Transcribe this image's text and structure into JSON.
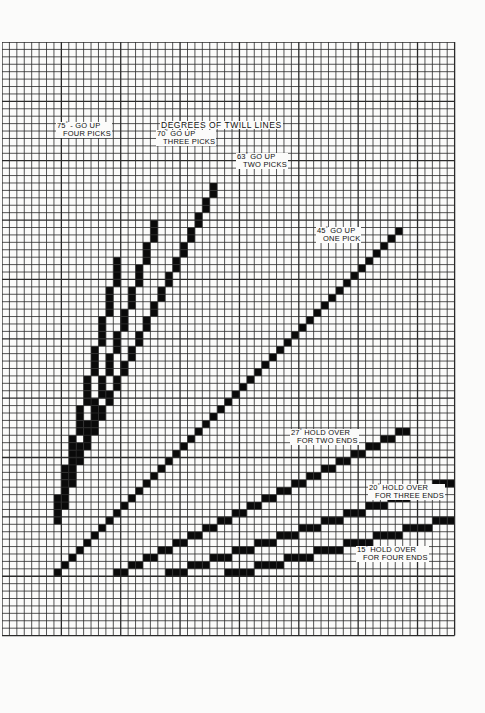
{
  "title": "DEGREES OF TWILL LINES",
  "grid": {
    "cols": 61,
    "rows": 80,
    "cell": 7.42,
    "line_color": "#2a2a2a",
    "fill_color": "#0a0a0a",
    "paper_color": "#fbfbfa"
  },
  "twill_lines": [
    {
      "id": "75",
      "degree": "75",
      "label_line1": "- GO UP",
      "label_line2": "FOUR PICKS",
      "start_col": 7,
      "start_row": 64,
      "dx": 1,
      "dy": 4,
      "steps": 9,
      "orient": "steep"
    },
    {
      "id": "70",
      "degree": "70",
      "label_line1": "GO UP",
      "label_line2": "THREE PICKS",
      "start_col": 8,
      "start_row": 62,
      "dx": 1,
      "dy": 3,
      "steps": 13,
      "orient": "steep"
    },
    {
      "id": "63",
      "degree": "63",
      "label_line1": "GO UP",
      "label_line2": "TWO PICKS",
      "start_col": 9,
      "start_row": 58,
      "dx": 1,
      "dy": 2,
      "steps": 20,
      "orient": "steep"
    },
    {
      "id": "45",
      "degree": "45",
      "label_line1": "GO UP",
      "label_line2": "ONE PICK",
      "start_col": 7,
      "start_row": 71,
      "dx": 1,
      "dy": 1,
      "steps": 47,
      "orient": "diag"
    },
    {
      "id": "27",
      "degree": "27",
      "label_line1": "HOLD OVER",
      "label_line2": "FOR TWO ENDS",
      "start_col": 15,
      "start_row": 71,
      "dx": 2,
      "dy": 1,
      "steps": 20,
      "orient": "flat"
    },
    {
      "id": "20",
      "degree": "20",
      "label_line1": "HOLD OVER",
      "label_line2": "FOR THREE ENDS",
      "start_col": 22,
      "start_row": 71,
      "dx": 3,
      "dy": 1,
      "steps": 13,
      "orient": "flat"
    },
    {
      "id": "15",
      "degree": "15",
      "label_line1": "HOLD OVER",
      "label_line2": "FOR FOUR ENDS",
      "start_col": 30,
      "start_row": 71,
      "dx": 4,
      "dy": 1,
      "steps": 8,
      "orient": "flat"
    }
  ],
  "labels": [
    {
      "for": "75",
      "x": 56,
      "y": 122,
      "deg": "75",
      "l1": " - GO UP",
      "l2": "FOUR PICKS"
    },
    {
      "for": "70",
      "x": 156,
      "y": 130,
      "deg": "70",
      "l1": " GO UP",
      "l2": "THREE PICKS"
    },
    {
      "for": "63",
      "x": 236,
      "y": 153,
      "deg": "63",
      "l1": " GO UP",
      "l2": "TWO PICKS"
    },
    {
      "for": "45",
      "x": 316,
      "y": 227,
      "deg": "45",
      "l1": " GO UP",
      "l2": "ONE PICK"
    },
    {
      "for": "27",
      "x": 290,
      "y": 429,
      "deg": "27",
      "l1": " HOLD OVER",
      "l2": "FOR TWO ENDS"
    },
    {
      "for": "20",
      "x": 368,
      "y": 484,
      "deg": "20",
      "l1": " HOLD OVER",
      "l2": "FOR THREE ENDS"
    },
    {
      "for": "15",
      "x": 356,
      "y": 546,
      "deg": "15",
      "l1": " HOLD OVER",
      "l2": "FOR FOUR ENDS"
    }
  ]
}
